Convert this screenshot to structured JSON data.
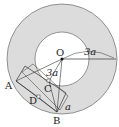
{
  "diagram": {
    "points": {
      "O": "O",
      "A": "A",
      "B": "B",
      "C": "C",
      "D": "D"
    },
    "measures": {
      "outer_radius": "3a",
      "inner_segment": "3a",
      "side": "a"
    },
    "colors": {
      "ring_fill": "#dcdcdc",
      "stroke": "#333333",
      "background": "#ffffff"
    }
  }
}
